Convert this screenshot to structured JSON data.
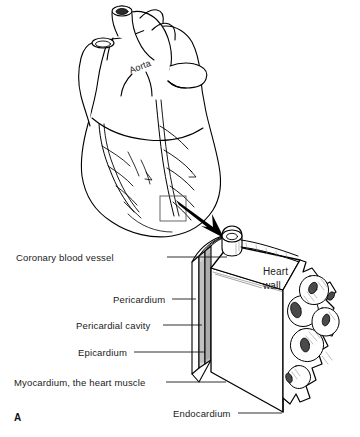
{
  "figure": {
    "panel_label": "A",
    "title_internal": "Heart wall layers",
    "background_color": "#ffffff",
    "ink_color": "#000000"
  },
  "heart_illustration": {
    "name": "anterior-view-of-heart",
    "labels": [
      {
        "id": "aorta",
        "text": "Aorta",
        "x": 128,
        "y": 72,
        "rotation_deg": -21
      }
    ],
    "callout": {
      "box": {
        "x": 160,
        "y": 196,
        "width": 26,
        "height": 25
      },
      "arrow": {
        "from_x": 180,
        "from_y": 204,
        "to_x": 224,
        "to_y": 238
      }
    }
  },
  "block_diagram": {
    "name": "heart-wall-block-cutaway",
    "callout_labels": [
      {
        "id": "heart-wall",
        "line1": "Heart",
        "line2": "wall",
        "x": 263,
        "y": 266
      }
    ]
  },
  "leader_labels": [
    {
      "id": "coronary-blood-vessel",
      "text": "Coronary blood vessel",
      "text_x": 16,
      "text_y": 252,
      "line": [
        [
          167,
          257
        ],
        [
          227,
          257
        ]
      ]
    },
    {
      "id": "pericardium",
      "text": "Pericardium",
      "text_x": 113,
      "text_y": 294,
      "line": [
        [
          172,
          299
        ],
        [
          196,
          299
        ]
      ]
    },
    {
      "id": "pericardial-cavity",
      "text": "Pericardial cavity",
      "text_x": 76,
      "text_y": 320,
      "line": [
        [
          163,
          325
        ],
        [
          202,
          325
        ]
      ]
    },
    {
      "id": "epicardium",
      "text": "Epicardium",
      "text_x": 78,
      "text_y": 347,
      "line": [
        [
          134,
          352
        ],
        [
          205,
          352
        ]
      ]
    },
    {
      "id": "myocardium",
      "text": "Myocardium, the heart muscle",
      "text_x": 14,
      "text_y": 377,
      "line": [
        [
          166,
          382
        ],
        [
          226,
          382
        ]
      ]
    },
    {
      "id": "endocardium",
      "text": "Endocardium",
      "text_x": 173,
      "text_y": 408,
      "line": [
        [
          238,
          413
        ],
        [
          282,
          413
        ]
      ]
    }
  ]
}
